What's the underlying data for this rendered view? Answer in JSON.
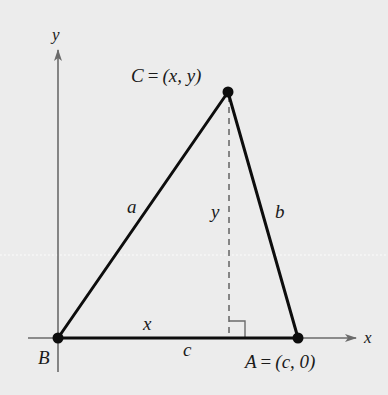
{
  "figure": {
    "background": "#ececec",
    "line_color": "#0d0d0d",
    "axis_color": "#6b6b6b",
    "axes": {
      "x_label": "x",
      "y_label": "y"
    },
    "points": {
      "B": {
        "label": "B"
      },
      "A": {
        "label": "A = (c, 0)",
        "name": "A",
        "coords": "(c, 0)"
      },
      "C": {
        "label": "C = (x, y)",
        "name": "C",
        "coords": "(x, y)"
      }
    },
    "sides": {
      "a": "a",
      "b": "b",
      "c": "c"
    },
    "segments": {
      "foot_x": "x",
      "height_y": "y"
    },
    "right_angle_marker": true
  }
}
